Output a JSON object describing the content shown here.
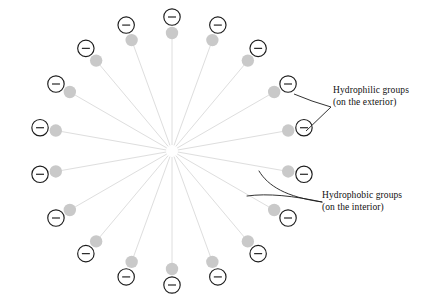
{
  "figure": {
    "type": "diagram",
    "background_color": "#ffffff",
    "center": {
      "x": 172,
      "y": 151
    },
    "ring_count": 18
  },
  "style": {
    "spoke_color": "#dedede",
    "dot_color": "#c9c9c9",
    "ring_stroke_color": "#1c1c1c",
    "ring_fill_color": "#ffffff",
    "leader_color": "#1c1c1c",
    "text_color": "#101010"
  },
  "geometry": {
    "dot_radius": 6.2,
    "ring_radius": 8.2,
    "minus_half_width": 4.0,
    "dot_ring_radius": 118,
    "ring_ring_radius": 134,
    "spoke_inner_radius": 6,
    "angles_deg": [
      270,
      290,
      310,
      330,
      350,
      10,
      30,
      50,
      70,
      90,
      110,
      130,
      150,
      170,
      190,
      210,
      230,
      250
    ]
  },
  "nodes": {
    "count": 18,
    "glyph": "minus",
    "glyph_char": "−",
    "head_name": "hydrophilic-head-group",
    "tail_name": "hydrophobic-tail"
  },
  "callouts": [
    {
      "id": "hydrophilic",
      "name": "callout-hydrophilic",
      "line1": "Hydrophilic groups",
      "line2": "(on the exterior)",
      "leader_type": "bracket",
      "leader_points": "294,94 312,101 331,107 306,131",
      "target_node_indices": [
        6,
        7
      ]
    },
    {
      "id": "hydrophobic",
      "name": "callout-hydrophobic",
      "line1": "Hydrophobic groups",
      "line2": "(on the interior)",
      "leader_type": "curve-brace",
      "leader_curve_upper": "M 259,171 C 268,186 286,197 322,202",
      "leader_curve_lower": "M 247,196 C 268,193 294,196 322,202",
      "target": "interior-spokes"
    }
  ]
}
